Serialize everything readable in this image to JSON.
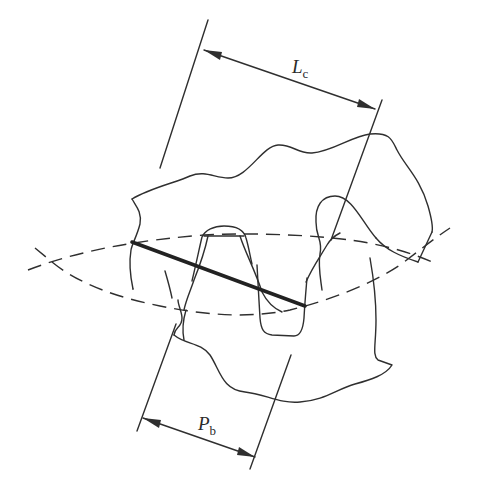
{
  "diagram": {
    "labels": {
      "length_of_contact": {
        "main": "L",
        "sub": "c"
      },
      "base_pitch": {
        "main": "P",
        "sub": "b"
      }
    },
    "colors": {
      "line": "#2f2f2f",
      "background": "#ffffff"
    }
  }
}
